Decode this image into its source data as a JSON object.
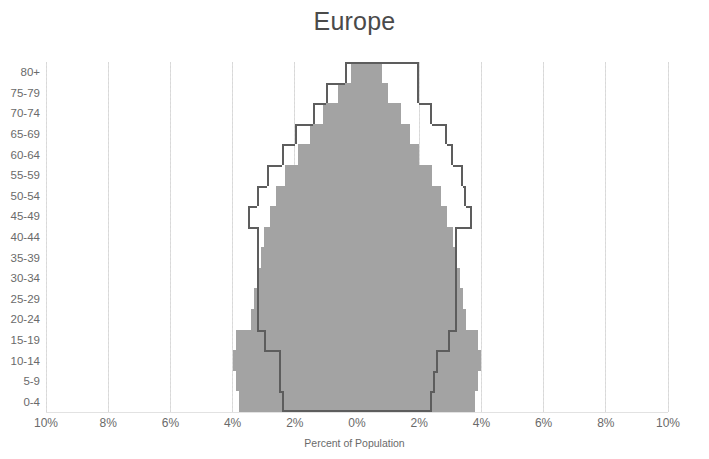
{
  "chart_data": {
    "type": "bar",
    "title": "Europe",
    "xlabel": "Percent of Population",
    "ylabel": "",
    "orientation": "horizontal-pyramid",
    "grid": true,
    "legend": "none",
    "xlim": [
      -10,
      10
    ],
    "xtick_values": [
      -10,
      -8,
      -6,
      -4,
      -2,
      0,
      2,
      4,
      6,
      8,
      10
    ],
    "xtick_labels": [
      "10%",
      "8%",
      "6%",
      "4%",
      "2%",
      "0%",
      "2%",
      "4%",
      "6%",
      "8%",
      "10%"
    ],
    "categories": [
      "80+",
      "75-79",
      "70-74",
      "65-69",
      "60-64",
      "55-59",
      "50-54",
      "45-49",
      "40-44",
      "35-39",
      "30-34",
      "25-29",
      "20-24",
      "15-19",
      "10-14",
      "5-9",
      "0-4"
    ],
    "series": [
      {
        "name": "filled-area",
        "style": "filled",
        "color": "#a3a3a3",
        "male_values": [
          0.2,
          0.6,
          1.1,
          1.5,
          1.9,
          2.3,
          2.6,
          2.8,
          3.0,
          3.1,
          3.2,
          3.3,
          3.4,
          3.9,
          4.0,
          3.9,
          3.8
        ],
        "female_values": [
          0.8,
          1.0,
          1.4,
          1.7,
          2.0,
          2.4,
          2.7,
          2.9,
          3.1,
          3.2,
          3.3,
          3.4,
          3.5,
          3.9,
          4.0,
          3.9,
          3.8
        ]
      },
      {
        "name": "outline-area",
        "style": "outline",
        "color": "#5d5d5d",
        "male_values": [
          0.4,
          1.0,
          1.4,
          2.0,
          2.4,
          2.9,
          3.2,
          3.5,
          3.2,
          3.2,
          3.2,
          3.2,
          3.2,
          3.0,
          2.5,
          2.5,
          2.4
        ],
        "female_values": [
          2.0,
          2.0,
          2.4,
          2.9,
          3.1,
          3.4,
          3.5,
          3.7,
          3.2,
          3.2,
          3.2,
          3.2,
          3.2,
          3.0,
          2.6,
          2.5,
          2.4
        ]
      }
    ]
  },
  "chart": {
    "title": "Europe",
    "x_axis_title": "Percent of Population",
    "x_ticks": [
      "10%",
      "8%",
      "6%",
      "4%",
      "2%",
      "0%",
      "2%",
      "4%",
      "6%",
      "8%",
      "10%"
    ],
    "y_ticks": [
      "80+",
      "75-79",
      "70-74",
      "65-69",
      "60-64",
      "55-59",
      "50-54",
      "45-49",
      "40-44",
      "35-39",
      "30-34",
      "25-29",
      "20-24",
      "15-19",
      "10-14",
      "5-9",
      "0-4"
    ],
    "colors": {
      "fill": "#a3a3a3",
      "outline": "#5d5d5d",
      "grid": "#dedede",
      "text": "#6a6a6a",
      "background": "#ffffff"
    }
  }
}
